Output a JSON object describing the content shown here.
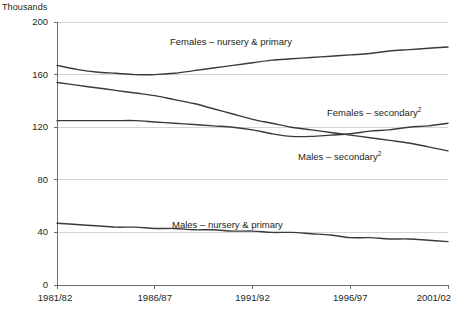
{
  "chart_data": {
    "type": "line",
    "title": "",
    "subtitle": "",
    "unit_label": "Thousands",
    "xlabel": "",
    "ylabel": "",
    "ylim": [
      0,
      200
    ],
    "yticks": [
      0,
      40,
      80,
      120,
      160,
      200
    ],
    "ytick_labels": [
      "0",
      "40",
      "80",
      "120",
      "160",
      "200"
    ],
    "grid": true,
    "grid_axis": "y",
    "legend_position": "inline-annotations",
    "x": [
      "1981/82",
      "1982/83",
      "1983/84",
      "1984/85",
      "1985/86",
      "1986/87",
      "1987/88",
      "1988/89",
      "1989/90",
      "1990/91",
      "1991/92",
      "1992/93",
      "1993/94",
      "1994/95",
      "1995/96",
      "1996/97",
      "1997/98",
      "1998/99",
      "1999/00",
      "2000/01",
      "2001/02"
    ],
    "xtick_labels": [
      "1981/82",
      "1986/87",
      "1991/92",
      "1996/97",
      "2001/02"
    ],
    "xtick_indices": [
      0,
      5,
      10,
      15,
      20
    ],
    "series": [
      {
        "name": "Females – nursery & primary",
        "label": "Females – nursery & primary",
        "footnote": "",
        "color": "#3a3a3a",
        "values": [
          167,
          164,
          162,
          161,
          160,
          160,
          161,
          163,
          165,
          167,
          169,
          171,
          172,
          173,
          174,
          175,
          176,
          178,
          179,
          180,
          181
        ]
      },
      {
        "name": "Males – secondary",
        "label": "Males – secondary",
        "footnote": "2",
        "color": "#3a3a3a",
        "values": [
          154,
          152,
          150,
          148,
          146,
          144,
          141,
          138,
          134,
          130,
          126,
          123,
          120,
          118,
          116,
          114,
          112,
          110,
          108,
          105,
          102
        ]
      },
      {
        "name": "Females – secondary",
        "label": "Females – secondary",
        "footnote": "2",
        "color": "#3a3a3a",
        "values": [
          125,
          125,
          125,
          125,
          125,
          124,
          123,
          122,
          121,
          120,
          118,
          115,
          113,
          113,
          114,
          115,
          117,
          118,
          120,
          121,
          123
        ]
      },
      {
        "name": "Males – nursery & primary",
        "label": "Males – nursery & primary",
        "footnote": "",
        "color": "#3a3a3a",
        "values": [
          47,
          46,
          45,
          44,
          44,
          43,
          43,
          42,
          42,
          41,
          41,
          40,
          40,
          39,
          38,
          36,
          36,
          35,
          35,
          34,
          33
        ]
      }
    ],
    "annotations": [
      {
        "text": "Females – nursery & primary",
        "footnote": "",
        "x_px": 170,
        "y_px": 36
      },
      {
        "text": "Females – secondary",
        "footnote": "2",
        "x_px": 327,
        "y_px": 107
      },
      {
        "text": "Males – secondary",
        "footnote": "2",
        "x_px": 298,
        "y_px": 151
      },
      {
        "text": "Males – nursery & primary",
        "footnote": "",
        "x_px": 172,
        "y_px": 219
      }
    ],
    "colors": {
      "line": "#3a3a3a",
      "grid": "#d4d4d4",
      "axis": "#6e6e6e",
      "text": "#231f20",
      "background": "#ffffff"
    }
  }
}
